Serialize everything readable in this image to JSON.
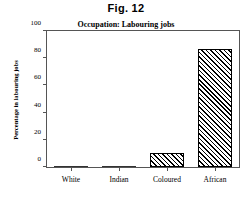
{
  "figure": {
    "number_label": "Fig. 12"
  },
  "chart_data": {
    "type": "bar",
    "title": "Occupation:  Labouring jobs",
    "xlabel": "",
    "ylabel": "Percentage in labouring jobs",
    "categories": [
      "White",
      "Indian",
      "Coloured",
      "African"
    ],
    "values": [
      0,
      1,
      10,
      87
    ],
    "ylim": [
      0,
      100
    ],
    "yticks": [
      0,
      20,
      40,
      60,
      80,
      100
    ],
    "ytick_labels": [
      "0",
      "20",
      "40",
      "60",
      "80",
      "100"
    ],
    "grid": false,
    "legend": null,
    "bar_style": {
      "fill": "diagonal-hatch",
      "hatch_color": "#000000",
      "edge_color": "#000000",
      "background": "#ffffff"
    },
    "frame_color": "#555555"
  }
}
